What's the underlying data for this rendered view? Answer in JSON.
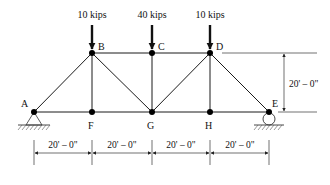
{
  "diagram": {
    "type": "pratt-style truss",
    "nodes": [
      {
        "id": "A",
        "label": "A",
        "x": 34,
        "y": 112,
        "label_dx": -12,
        "label_dy": -5
      },
      {
        "id": "B",
        "label": "B",
        "x": 92,
        "y": 53,
        "label_dx": 6,
        "label_dy": -6
      },
      {
        "id": "C",
        "label": "C",
        "x": 152,
        "y": 53,
        "label_dx": 6,
        "label_dy": -6
      },
      {
        "id": "D",
        "label": "D",
        "x": 210,
        "y": 53,
        "label_dx": 6,
        "label_dy": -6
      },
      {
        "id": "E",
        "label": "E",
        "x": 269,
        "y": 112,
        "label_dx": 3,
        "label_dy": -7
      },
      {
        "id": "F",
        "label": "F",
        "x": 92,
        "y": 112,
        "label_dx": -4,
        "label_dy": 16
      },
      {
        "id": "G",
        "label": "G",
        "x": 152,
        "y": 112,
        "label_dx": -4,
        "label_dy": 16
      },
      {
        "id": "H",
        "label": "H",
        "x": 210,
        "y": 112,
        "label_dx": -4,
        "label_dy": 16
      }
    ],
    "members": [
      [
        "A",
        "F"
      ],
      [
        "F",
        "G"
      ],
      [
        "G",
        "H"
      ],
      [
        "H",
        "E"
      ],
      [
        "B",
        "C"
      ],
      [
        "C",
        "D"
      ],
      [
        "A",
        "B"
      ],
      [
        "B",
        "F"
      ],
      [
        "B",
        "G"
      ],
      [
        "C",
        "G"
      ],
      [
        "G",
        "D"
      ],
      [
        "D",
        "H"
      ],
      [
        "D",
        "E"
      ]
    ],
    "loads": [
      {
        "node": "B",
        "label": "10 kips"
      },
      {
        "node": "C",
        "label": "40 kips"
      },
      {
        "node": "D",
        "label": "10 kips"
      }
    ],
    "supports": [
      {
        "node": "A",
        "type": "pin"
      },
      {
        "node": "E",
        "type": "roller"
      }
    ],
    "horizontal_dimensions": [
      {
        "from": "A",
        "to": "F",
        "label": "20' – 0\""
      },
      {
        "from": "F",
        "to": "G",
        "label": "20' – 0\""
      },
      {
        "from": "G",
        "to": "H",
        "label": "20' – 0\""
      },
      {
        "from": "H",
        "to": "E",
        "label": "20' – 0\""
      }
    ],
    "vertical_dimension": {
      "label": "20' – 0\""
    }
  },
  "labels": {
    "load_B": "10 kips",
    "load_C": "40 kips",
    "load_D": "10 kips",
    "node_A": "A",
    "node_B": "B",
    "node_C": "C",
    "node_D": "D",
    "node_E": "E",
    "node_F": "F",
    "node_G": "G",
    "node_H": "H",
    "dim_AF": "20' – 0\"",
    "dim_FG": "20' – 0\"",
    "dim_GH": "20' – 0\"",
    "dim_HE": "20' – 0\"",
    "dim_height": "20' – 0\""
  }
}
